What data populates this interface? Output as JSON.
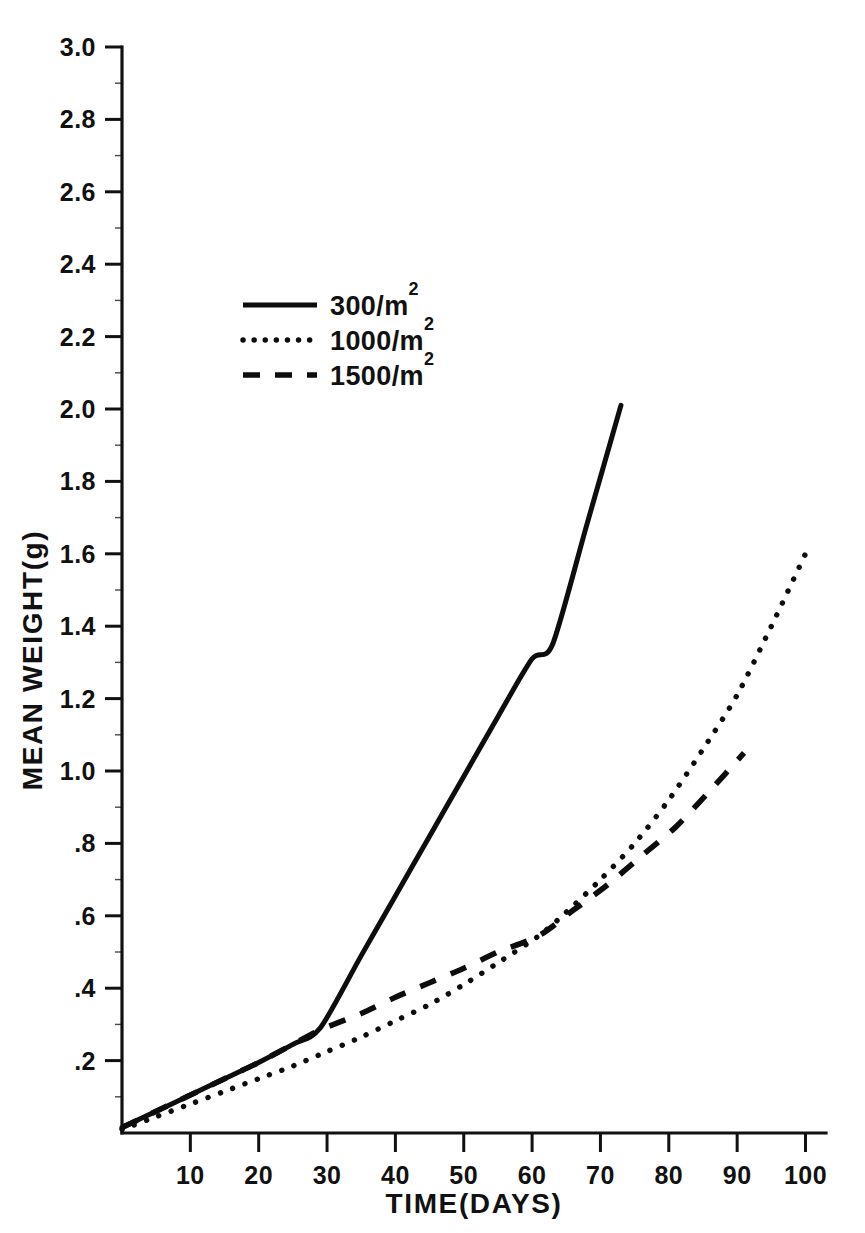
{
  "chart_data": {
    "type": "line",
    "title": "",
    "xlabel": "TIME(DAYS)",
    "ylabel": "MEAN WEIGHT(g)",
    "xlim": [
      0,
      103
    ],
    "ylim": [
      0,
      3.0
    ],
    "grid": false,
    "legend_position": "upper-left-inside",
    "x_ticks": [
      10,
      20,
      30,
      40,
      50,
      60,
      70,
      80,
      90,
      100
    ],
    "x_tick_labels": [
      "10",
      "20",
      "30",
      "40",
      "50",
      "60",
      "70",
      "80",
      "90",
      "100"
    ],
    "y_ticks": [
      0.2,
      0.4,
      0.6,
      0.8,
      1.0,
      1.2,
      1.4,
      1.6,
      1.8,
      2.0,
      2.2,
      2.4,
      2.6,
      2.8,
      3.0
    ],
    "y_tick_labels": [
      ".2",
      ".4",
      ".6",
      ".8",
      "1.0",
      "1.2",
      "1.4",
      "1.6",
      "1.8",
      "2.0",
      "2.2",
      "2.4",
      "2.6",
      "2.8",
      "3.0"
    ],
    "y_minor_ticks": [
      0.1,
      0.3,
      0.5,
      0.7,
      0.9,
      1.1,
      1.3,
      1.5,
      1.7,
      1.9,
      2.1,
      2.3,
      2.5,
      2.7,
      2.9
    ],
    "series": [
      {
        "name": "300/m2",
        "label_base": "300/m",
        "label_sup": "2",
        "style": "solid",
        "color": "#0d0d0d",
        "x": [
          0,
          5,
          10,
          15,
          20,
          25,
          29,
          35,
          40,
          45,
          50,
          55,
          60,
          63,
          68,
          73
        ],
        "y": [
          0.015,
          0.06,
          0.105,
          0.15,
          0.195,
          0.245,
          0.29,
          0.49,
          0.655,
          0.82,
          0.985,
          1.15,
          1.31,
          1.35,
          1.68,
          2.01
        ]
      },
      {
        "name": "1000/m2",
        "label_base": "1000/m",
        "label_sup": "2",
        "style": "dotted",
        "color": "#0d0d0d",
        "x": [
          0,
          5,
          10,
          15,
          20,
          25,
          30,
          35,
          40,
          45,
          50,
          55,
          61,
          65,
          70,
          75,
          80,
          85,
          90,
          95,
          100
        ],
        "y": [
          0.01,
          0.045,
          0.08,
          0.115,
          0.15,
          0.185,
          0.225,
          0.265,
          0.31,
          0.355,
          0.41,
          0.47,
          0.545,
          0.61,
          0.7,
          0.8,
          0.92,
          1.06,
          1.21,
          1.4,
          1.6
        ]
      },
      {
        "name": "1500/m2",
        "label_base": "1500/m",
        "label_sup": "2",
        "style": "dashed",
        "color": "#0d0d0d",
        "x": [
          0,
          5,
          10,
          15,
          20,
          25,
          29,
          35,
          40,
          45,
          50,
          55,
          61,
          66,
          71,
          76,
          81,
          86,
          91
        ],
        "y": [
          0.015,
          0.06,
          0.105,
          0.15,
          0.195,
          0.245,
          0.285,
          0.33,
          0.375,
          0.415,
          0.455,
          0.5,
          0.545,
          0.615,
          0.685,
          0.765,
          0.845,
          0.945,
          1.05
        ]
      }
    ]
  },
  "legend": {
    "entries": [
      {
        "label_base": "300/m",
        "label_sup": "2",
        "style": "solid"
      },
      {
        "label_base": "1000/m",
        "label_sup": "2",
        "style": "dotted"
      },
      {
        "label_base": "1500/m",
        "label_sup": "2",
        "style": "dashed"
      }
    ]
  }
}
